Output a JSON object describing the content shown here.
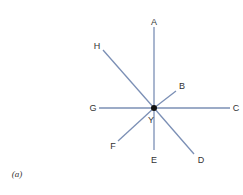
{
  "diagram": {
    "center": {
      "label": "Y",
      "x": 154,
      "y": 108
    },
    "line_color": "#7b8fb5",
    "center_color": "#111111",
    "rays": [
      {
        "label": "A",
        "x2": 154,
        "y2": 27,
        "lx": 154,
        "ly": 25
      },
      {
        "label": "B",
        "x2": 176,
        "y2": 91,
        "lx": 182,
        "ly": 89
      },
      {
        "label": "C",
        "x2": 230,
        "y2": 108,
        "lx": 236,
        "ly": 111
      },
      {
        "label": "D",
        "x2": 194,
        "y2": 154,
        "lx": 201,
        "ly": 163
      },
      {
        "label": "E",
        "x2": 154,
        "y2": 150,
        "lx": 154,
        "ly": 163
      },
      {
        "label": "F",
        "x2": 118,
        "y2": 141,
        "lx": 113,
        "ly": 149
      },
      {
        "label": "G",
        "x2": 99,
        "y2": 108,
        "lx": 93,
        "ly": 111
      },
      {
        "label": "H",
        "x2": 103,
        "y2": 50,
        "lx": 97,
        "ly": 49
      }
    ],
    "caption": "(a)"
  }
}
